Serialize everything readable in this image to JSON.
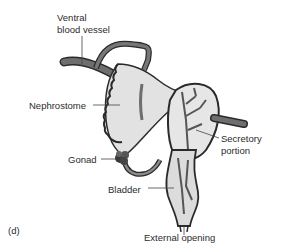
{
  "figure": {
    "panel_label": "(d)",
    "labels": {
      "ventral_blood_vessel_line1": "Ventral",
      "ventral_blood_vessel_line2": "blood vessel",
      "nephrostome": "Nephrostome",
      "gonad": "Gonad",
      "bladder": "Bladder",
      "secretory_line1": "Secretory",
      "secretory_line2": "portion",
      "external_opening": "External opening"
    },
    "colors": {
      "outline": "#2a2a2a",
      "tube": "#6e6e6e",
      "fill_light": "#e2e2e2",
      "text": "#2b2b2b"
    }
  }
}
